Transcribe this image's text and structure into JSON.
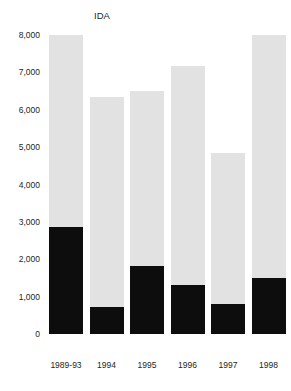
{
  "chart_data": {
    "type": "bar",
    "stacked": true,
    "title": "",
    "subtitle": "",
    "xlabel": "",
    "ylabel": "",
    "categories": [
      "1989-93",
      "1994",
      "1995",
      "1996",
      "1997",
      "1998"
    ],
    "series": [
      {
        "name": "IBRD",
        "color": "#0d0d0d",
        "values": [
          2870,
          730,
          1830,
          1310,
          790,
          1500
        ]
      },
      {
        "name": "IDA",
        "color": "#e2e2e2",
        "values": [
          5130,
          5620,
          4670,
          5860,
          4050,
          6490
        ]
      }
    ],
    "totals": [
      8000,
      6350,
      6500,
      7170,
      4840,
      7990
    ],
    "ylim": [
      0,
      8000
    ],
    "yticks": [
      0,
      1000,
      2000,
      3000,
      4000,
      5000,
      6000,
      7000,
      8000
    ],
    "ytick_labels": [
      "0",
      "1,000",
      "2,000",
      "3,000",
      "4,000",
      "5,000",
      "6,000",
      "7,000",
      "8,000"
    ],
    "grid": false,
    "legend_position": "inline-annotation",
    "annotations": [
      {
        "text": "IDA",
        "target": "top-segment-first-bar"
      },
      {
        "text": "IBRD",
        "target": "bottom-segment-first-bar"
      }
    ]
  }
}
